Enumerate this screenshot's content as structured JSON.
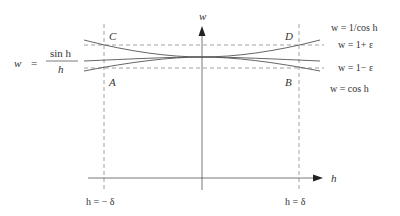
{
  "diagram": {
    "axes": {
      "w_label": "w",
      "h_label": "h"
    },
    "function_label": {
      "lhs": "w",
      "eq": "=",
      "numerator": "sin  h",
      "denominator": "h"
    },
    "corner_labels": {
      "C": "C",
      "D": "D",
      "A": "A",
      "B": "B"
    },
    "curve_labels": {
      "upper": "w = 1/cos  h",
      "plus_eps": "w = 1+ ε",
      "minus_eps": "w = 1− ε",
      "lower": "w = cos  h"
    },
    "bound_labels": {
      "left": "h = − δ",
      "right": "h = δ"
    },
    "colors": {
      "line": "#555555",
      "dash": "#888888",
      "text": "#333333"
    }
  }
}
